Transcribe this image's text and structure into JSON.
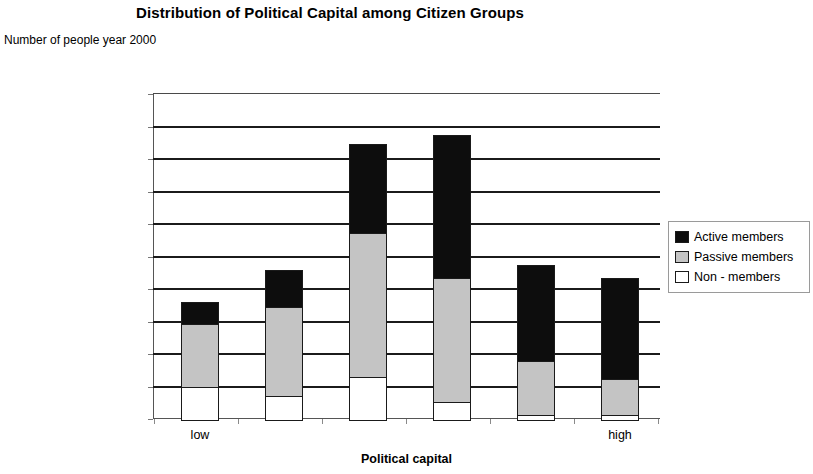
{
  "chart_data": {
    "type": "bar",
    "subtype": "stacked-vertical",
    "title": "Distribution of Political Capital among Citizen Groups",
    "subtitle": "Number of people year 2000",
    "xlabel": "Political capital",
    "ylabel": "",
    "categories": [
      "1",
      "2",
      "3",
      "4",
      "5",
      "6"
    ],
    "xtick_labels": [
      "low",
      "",
      "",
      "",
      "",
      "high"
    ],
    "ylim": [
      0,
      2000000
    ],
    "ytick_step": 200000,
    "ytick_labels": [
      "2000000",
      "1800000",
      "1600000",
      "1400000",
      "1200000",
      "1000000",
      "800000",
      "600000",
      "400000",
      "200000",
      "0"
    ],
    "ytick_values": [
      2000000,
      1800000,
      1600000,
      1400000,
      1200000,
      1000000,
      800000,
      600000,
      400000,
      200000,
      0
    ],
    "grid": true,
    "grid_axis": "y",
    "legend_position": "right",
    "stack_order_bottom_to_top": [
      "Non  - members",
      "Passive members",
      "Active members"
    ],
    "series": [
      {
        "name": "Active members",
        "color": "#0d0d0d",
        "values": [
          130000,
          230000,
          540000,
          875000,
          590000,
          620000
        ]
      },
      {
        "name": "Passive members",
        "color": "#c4c4c4",
        "values": [
          390000,
          545000,
          890000,
          765000,
          330000,
          225000
        ]
      },
      {
        "name": "Non  - members",
        "color": "#ffffff",
        "values": [
          200000,
          145000,
          260000,
          105000,
          30000,
          25000
        ]
      }
    ],
    "totals": [
      720000,
      920000,
      1690000,
      1745000,
      950000,
      870000
    ]
  },
  "legend": {
    "items": [
      {
        "label": "Active members",
        "swatch": "black-square-icon"
      },
      {
        "label": "Passive members",
        "swatch": "gray-square-icon"
      },
      {
        "label": "Non   - members",
        "swatch": "white-square-icon"
      }
    ]
  }
}
